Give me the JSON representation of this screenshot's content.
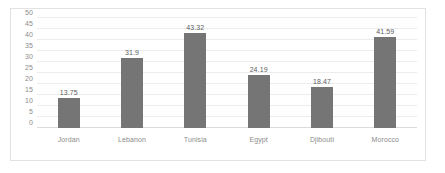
{
  "chart_data": {
    "type": "bar",
    "title": "",
    "subtitle": "",
    "xlabel": "",
    "ylabel": "",
    "categories": [
      "Jordan",
      "Lebanon",
      "Tunisia",
      "Egypt",
      "Djibouti",
      "Morocco"
    ],
    "values": [
      13.75,
      31.9,
      43.32,
      24.19,
      18.47,
      41.59
    ],
    "value_labels": [
      "13.75",
      "31.9",
      "43.32",
      "24.19",
      "18.47",
      "41.59"
    ],
    "ylim": [
      0,
      50
    ],
    "yticks": [
      0,
      5,
      10,
      15,
      20,
      25,
      30,
      35,
      40,
      45,
      50
    ],
    "ytick_labels": [
      "0",
      "5",
      "10",
      "15",
      "20",
      "25",
      "30",
      "35",
      "40",
      "45",
      "50"
    ],
    "grid": true,
    "legend": false,
    "legend_position": "none",
    "series": [
      {
        "name": "",
        "values": [
          13.75,
          31.9,
          43.32,
          24.19,
          18.47,
          41.59
        ],
        "color": "#757575"
      }
    ],
    "colors": {
      "bar": "#757575",
      "gridline": "#ececed",
      "baseline": "#dcdcdc",
      "tick_text": "#8c8c8c",
      "value_text": "#5d5d5d",
      "frame": "#e2e2e2",
      "background": "#ffffff"
    }
  }
}
